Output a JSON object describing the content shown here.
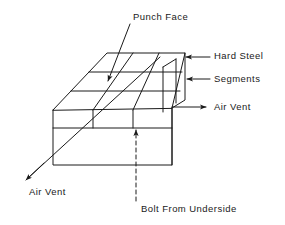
{
  "diagram": {
    "stroke_color": "#1a1a1a",
    "background_color": "#ffffff",
    "labels": {
      "punch_face": "Punch Face",
      "hard_steel": "Hard Steel",
      "segments": "Segments",
      "air_vent_right": "Air Vent",
      "air_vent_left": "Air Vent",
      "bolt_from_underside": "Bolt From Underside"
    },
    "icons": {
      "punch_face_arrow": "arrow-down-left-icon",
      "hard_steel_arrow": "arrow-left-icon",
      "segments_arrow": "arrow-left-icon",
      "air_vent_right_arrow": "arrow-right-icon",
      "air_vent_left_arrow": "arrow-down-left-icon",
      "bolt_arrow": "dashed-arrow-up-icon"
    },
    "geometry": {
      "top_face_segment_rows": 3,
      "top_face_segment_columns": 3,
      "front_face_segment_columns": 3
    }
  }
}
